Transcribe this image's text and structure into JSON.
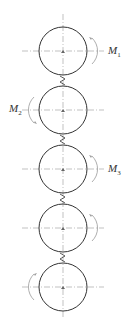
{
  "diagram": {
    "title": "",
    "gears": [
      {
        "id": 1,
        "cx": 63,
        "cy": 51,
        "r": 24,
        "moment_label": "M",
        "moment_sub": "1",
        "arrow_side": "right",
        "label_visible": true
      },
      {
        "id": 2,
        "cx": 63,
        "cy": 110,
        "r": 24,
        "moment_label": "M",
        "moment_sub": "2",
        "arrow_side": "left",
        "label_visible": true
      },
      {
        "id": 3,
        "cx": 63,
        "cy": 169,
        "r": 24,
        "moment_label": "M",
        "moment_sub": "3",
        "arrow_side": "right",
        "label_visible": true
      },
      {
        "id": 4,
        "cx": 63,
        "cy": 228,
        "r": 24,
        "moment_label": "",
        "moment_sub": "",
        "arrow_side": "right",
        "label_visible": false
      },
      {
        "id": 5,
        "cx": 63,
        "cy": 287,
        "r": 24,
        "moment_label": "",
        "moment_sub": "",
        "arrow_side": "left",
        "label_visible": false
      }
    ],
    "labels": {
      "m1": {
        "main": "M",
        "sub": "1"
      },
      "m2": {
        "main": "M",
        "sub": "2"
      },
      "m3": {
        "main": "M",
        "sub": "3"
      }
    },
    "colors": {
      "circle": "#333333",
      "centerline": "#888888",
      "arrow": "#999999"
    }
  }
}
